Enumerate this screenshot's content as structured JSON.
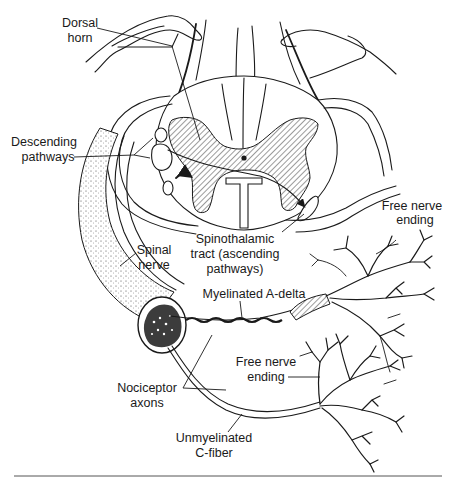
{
  "figure": {
    "type": "anatomical-diagram",
    "labels": {
      "dorsal_horn": [
        "Dorsal",
        "horn"
      ],
      "descending_pathways": [
        "Descending",
        "pathways"
      ],
      "spinothalamic_tract": [
        "Spinothalamic",
        "tract (ascending",
        "pathways)"
      ],
      "free_nerve_ending_top": [
        "Free nerve",
        "ending"
      ],
      "spinal_nerve": [
        "Spinal",
        "nerve"
      ],
      "myelinated_a_delta": "Myelinated A-delta",
      "free_nerve_ending_bottom": [
        "Free nerve",
        "ending"
      ],
      "nociceptor_axons": [
        "Nociceptor",
        "axons"
      ],
      "unmyelinated_c_fiber": [
        "Unmyelinated",
        "C-fiber"
      ]
    },
    "colors": {
      "ink": "#1a1a1a",
      "background": "#ffffff",
      "rule": "#555555"
    }
  }
}
